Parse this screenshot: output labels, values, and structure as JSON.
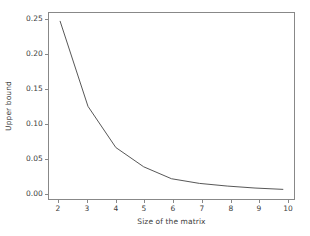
{
  "chart_data": {
    "type": "line",
    "title": "",
    "subtitle": "",
    "xlabel": "Size of the matrix",
    "ylabel": "Upper bound",
    "x": [
      2,
      3,
      4,
      5,
      6,
      7,
      8,
      9,
      10
    ],
    "values": [
      0.255,
      0.127,
      0.065,
      0.036,
      0.018,
      0.011,
      0.007,
      0.004,
      0.002
    ],
    "series": [
      {
        "name": "Upper bound",
        "values": [
          0.255,
          0.127,
          0.065,
          0.036,
          0.018,
          0.011,
          0.007,
          0.004,
          0.002
        ]
      }
    ],
    "xlim": [
      1.6,
      10.4
    ],
    "ylim": [
      -0.0125,
      0.2675
    ],
    "xticks": [
      2,
      3,
      4,
      5,
      6,
      7,
      8,
      9,
      10
    ],
    "xtick_labels": [
      "2",
      "3",
      "4",
      "5",
      "6",
      "7",
      "8",
      "9",
      "10"
    ],
    "yticks": [
      0.0,
      0.05,
      0.1,
      0.15,
      0.2,
      0.25
    ],
    "ytick_labels": [
      "0.00",
      "0.05",
      "0.10",
      "0.15",
      "0.20",
      "0.25"
    ],
    "grid": false,
    "legend": false,
    "legend_position": "none",
    "annotations": [],
    "line_color": "#555555",
    "line_width": 1.0,
    "background_color": "#ffffff",
    "axis_color": "#888888",
    "tick_label_color": "#3c3c3c"
  }
}
